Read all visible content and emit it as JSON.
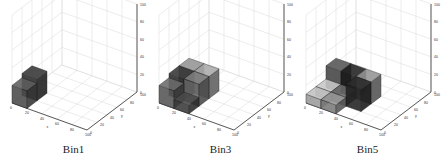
{
  "chart_data": [
    {
      "type": "bar3d",
      "title": "Bin1",
      "xlabel": "x",
      "ylabel": "y",
      "zlabel": "z",
      "xlim": [
        0,
        100
      ],
      "ylim": [
        0,
        100
      ],
      "zlim": [
        0,
        100
      ],
      "ticks": [
        0,
        20,
        40,
        60,
        80,
        100
      ],
      "grid": true,
      "bars": [
        {
          "x": 0,
          "y": 0,
          "dx": 20,
          "dy": 20,
          "z": 20,
          "shade": "#4a4a4a"
        },
        {
          "x": 0,
          "y": 20,
          "dx": 20,
          "dy": 20,
          "z": 25,
          "shade": "#2a2a2a"
        }
      ]
    },
    {
      "type": "bar3d",
      "title": "Bin3",
      "xlabel": "x",
      "ylabel": "y",
      "zlabel": "z",
      "xlim": [
        0,
        100
      ],
      "ylim": [
        0,
        100
      ],
      "zlim": [
        0,
        100
      ],
      "ticks": [
        0,
        20,
        40,
        60,
        80,
        100
      ],
      "grid": true,
      "bars": [
        {
          "x": 0,
          "y": 0,
          "dx": 20,
          "dy": 20,
          "z": 20,
          "shade": "#555555"
        },
        {
          "x": 20,
          "y": 0,
          "dx": 20,
          "dy": 20,
          "z": 10,
          "shade": "#3a3a3a"
        },
        {
          "x": 0,
          "y": 20,
          "dx": 20,
          "dy": 20,
          "z": 25,
          "shade": "#2a2a2a"
        },
        {
          "x": 20,
          "y": 20,
          "dx": 20,
          "dy": 20,
          "z": 25,
          "shade": "#666666"
        },
        {
          "x": 0,
          "y": 40,
          "dx": 20,
          "dy": 20,
          "z": 25,
          "shade": "#777777"
        },
        {
          "x": 20,
          "y": 40,
          "dx": 20,
          "dy": 20,
          "z": 25,
          "shade": "#888888"
        }
      ]
    },
    {
      "type": "bar3d",
      "title": "Bin5",
      "xlabel": "x",
      "ylabel": "y",
      "zlabel": "z",
      "xlim": [
        0,
        100
      ],
      "ylim": [
        0,
        100
      ],
      "zlim": [
        0,
        100
      ],
      "ticks": [
        0,
        20,
        40,
        60,
        80,
        100
      ],
      "grid": true,
      "bars": [
        {
          "x": 0,
          "y": 0,
          "dx": 20,
          "dy": 20,
          "z": 10,
          "shade": "#9a9a9a"
        },
        {
          "x": 20,
          "y": 0,
          "dx": 20,
          "dy": 20,
          "z": 10,
          "shade": "#7a7a7a"
        },
        {
          "x": 0,
          "y": 20,
          "dx": 20,
          "dy": 20,
          "z": 10,
          "shade": "#a0a0a0"
        },
        {
          "x": 20,
          "y": 20,
          "dx": 20,
          "dy": 20,
          "z": 10,
          "shade": "#555555"
        },
        {
          "x": 40,
          "y": 20,
          "dx": 20,
          "dy": 20,
          "z": 25,
          "shade": "#222222"
        },
        {
          "x": 0,
          "y": 40,
          "dx": 20,
          "dy": 20,
          "z": 25,
          "shade": "#444444"
        },
        {
          "x": 20,
          "y": 40,
          "dx": 20,
          "dy": 20,
          "z": 25,
          "shade": "#1a1a1a"
        },
        {
          "x": 40,
          "y": 40,
          "dx": 20,
          "dy": 20,
          "z": 25,
          "shade": "#777777"
        }
      ]
    }
  ],
  "panels": [
    {
      "label": "Bin1"
    },
    {
      "label": "Bin3"
    },
    {
      "label": "Bin5"
    }
  ]
}
